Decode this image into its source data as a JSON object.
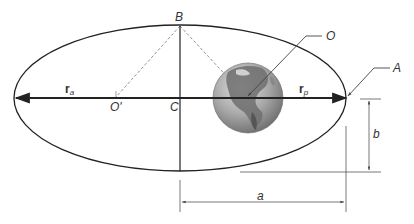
{
  "figure": {
    "labels": {
      "B": "B",
      "O": "O",
      "O_prime": "O'",
      "C": "C",
      "A": "A",
      "a": "a",
      "b": "b",
      "r_a_main": "r",
      "r_a_sub": "a",
      "r_p_main": "r",
      "r_p_sub": "p"
    },
    "elements": {
      "ellipse": "orbit",
      "focus_occupied": "Earth (O)",
      "focus_empty": "O'",
      "center": "C",
      "vertex_minor": "B",
      "perigee_point": "A",
      "apogee_vector": "r_a",
      "perigee_vector": "r_p",
      "semi_major_axis": "a",
      "semi_minor_axis": "b"
    },
    "colors": {
      "line": "#222222",
      "dashed": "#888888",
      "dimension": "#555555",
      "earth_ocean": "#a8a8a8",
      "earth_land": "#6e6e6e"
    }
  }
}
